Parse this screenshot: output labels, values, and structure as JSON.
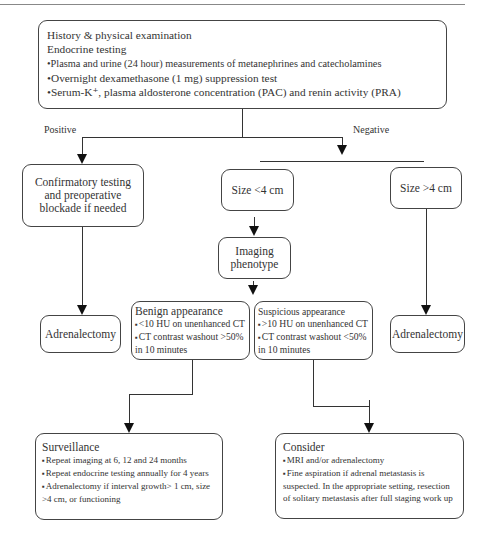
{
  "flowchart": {
    "top_box": {
      "lines": [
        "History & physical examination",
        "Endocrine testing",
        "Plasma and urine (24 hour) measurements of metanephrines and catecholamines",
        "Overnight dexamethasone (1 mg) suppression test",
        "Serum-K⁺, plasma aldosterone concentration (PAC) and renin activity (PRA)"
      ]
    },
    "branch_labels": {
      "positive": "Positive",
      "negative": "Negative"
    },
    "confirmatory": {
      "text": "Confirmatory testing and preoperative blockade if needed"
    },
    "size_small": {
      "text": "Size <4 cm"
    },
    "size_large": {
      "text": "Size >4 cm"
    },
    "imaging": {
      "text": "Imaging phenotype"
    },
    "adrenalectomy_left": {
      "text": "Adrenalectomy"
    },
    "adrenalectomy_right": {
      "text": "Adrenalectomy"
    },
    "benign": {
      "title": "Benign appearance",
      "items": [
        "<10 HU on unenhanced CT",
        "CT contrast washout >50%"
      ],
      "tail": "in 10 minutes"
    },
    "suspicious": {
      "title": "Suspicious appearance",
      "items": [
        ">10 HU on unenhanced CT",
        "CT contrast washout <50%"
      ],
      "tail": "in 10 minutes"
    },
    "surveillance": {
      "title": "Surveillance",
      "items": [
        "Repeat imaging at 6, 12 and 24 months",
        "Repeat endocrine testing annually for 4 years",
        "Adrenalectomy if interval growth> 1 cm, size >4 cm, or functioning"
      ]
    },
    "consider": {
      "title": "Consider",
      "items": [
        "MRI and/or adrenalectomy",
        "Fine aspiration if adrenal metastasis is suspected. In the appropriate setting, resection of solitary metastasis after full staging work up"
      ]
    }
  }
}
